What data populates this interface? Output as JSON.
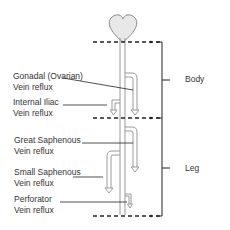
{
  "diagram": {
    "sections": [
      {
        "label": "Body"
      },
      {
        "label": "Leg"
      }
    ],
    "labels": [
      {
        "line1": "Gonadal (Ovarian)",
        "line2": "Vein reflux"
      },
      {
        "line1": "Internal Iliac",
        "line2": "Vein reflux"
      },
      {
        "line1": "Great Saphenous",
        "line2": "Vein reflux"
      },
      {
        "line1": "Small Saphenous",
        "line2": "Vein reflux"
      },
      {
        "line1": "Perforator",
        "line2": "Vein reflux"
      }
    ],
    "colors": {
      "heart_fill": "#e8e8e8",
      "vein_stroke": "#9a9a9a",
      "line": "#222222"
    }
  }
}
